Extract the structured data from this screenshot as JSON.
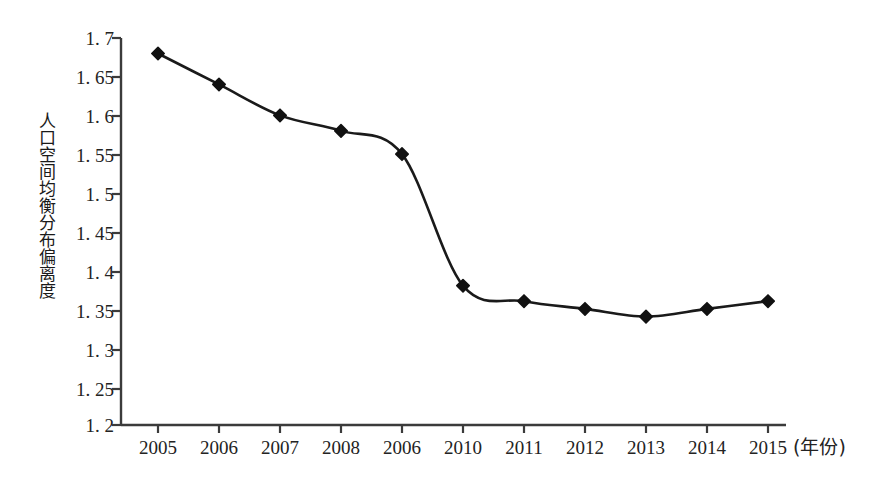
{
  "chart_data": {
    "type": "line",
    "title": "",
    "subtitle": "",
    "xlabel": "(年份)",
    "ylabel": "人口空间均衡分布偏离度",
    "x": [
      "2005",
      "2006",
      "2007",
      "2008",
      "2006",
      "2010",
      "2011",
      "2012",
      "2013",
      "2014",
      "2015"
    ],
    "categories": [
      "2005",
      "2006",
      "2007",
      "2008",
      "2006",
      "2010",
      "2011",
      "2012",
      "2013",
      "2014",
      "2015"
    ],
    "values": [
      1.68,
      1.64,
      1.6,
      1.58,
      1.55,
      1.38,
      1.36,
      1.35,
      1.34,
      1.35,
      1.36
    ],
    "series": [
      {
        "name": "人口空间均衡分布偏离度",
        "values": [
          1.68,
          1.64,
          1.6,
          1.58,
          1.55,
          1.38,
          1.36,
          1.35,
          1.34,
          1.35,
          1.36
        ]
      }
    ],
    "ylim": [
      1.2,
      1.7
    ],
    "ytick_step": 0.05,
    "yticks": [
      1.7,
      1.65,
      1.6,
      1.55,
      1.5,
      1.45,
      1.4,
      1.35,
      1.3,
      1.25,
      1.2
    ],
    "ytick_labels": [
      "1. 7",
      "1. 65",
      "1. 6",
      "1. 55",
      "1. 5",
      "1. 45",
      "1. 4",
      "1. 35",
      "1. 3",
      "1. 25",
      "1. 2"
    ],
    "grid": false,
    "legend": "none",
    "smoothing": "spline",
    "marker": "diamond",
    "line_color": "#1a1a1a",
    "marker_color": "#111111",
    "axis_color": "#3b3b3b",
    "background": "#ffffff"
  }
}
